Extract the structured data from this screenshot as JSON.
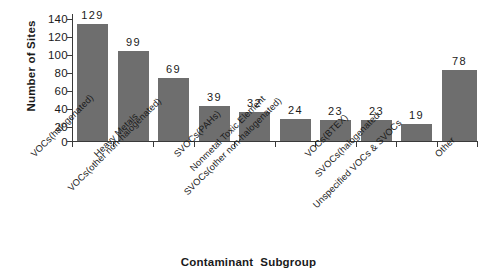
{
  "chart_data": {
    "type": "bar",
    "title": "",
    "xlabel_part1": "Contaminant",
    "xlabel_part2": "Subgroup",
    "xlabel": "Contaminant  Subgroup",
    "ylabel": "Number of Sites",
    "ylim": [
      0,
      140
    ],
    "ytick_values": [
      140,
      120,
      100,
      80,
      60,
      40,
      20,
      0
    ],
    "ytick_labels": [
      "140",
      "120",
      "100",
      "80",
      "60",
      "40",
      "20",
      "0"
    ],
    "grid": false,
    "legend": "none",
    "bar_color": "#6e6e6e",
    "axis_color": "#3a3a3a",
    "categories": [
      "VOCs(halogenated)",
      "Heavy Metals",
      "VOCs(other non-halogenated)",
      "SVOCs(PAHs)",
      "Nonmetal Toxic Element",
      "SVOCs(other non-halogenated)",
      "VOCs(BTEX)",
      "SVOCs(halogenated",
      "Unspecified VOCs & SVOCs",
      "Other"
    ],
    "values": [
      129,
      99,
      69,
      39,
      32,
      24,
      23,
      23,
      19,
      78
    ],
    "value_labels": [
      "129",
      "99",
      "69",
      "39",
      "32",
      "24",
      "23",
      "23",
      "19",
      "78"
    ]
  }
}
